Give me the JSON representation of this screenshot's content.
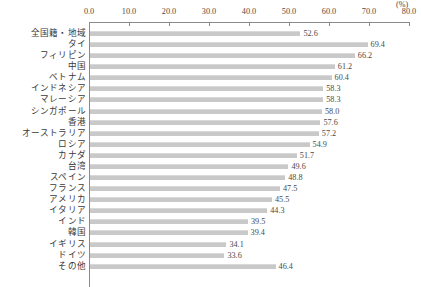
{
  "chart_data": {
    "type": "bar",
    "orientation": "horizontal",
    "title": "",
    "subtitle": "",
    "xlabel": "(%)",
    "ylabel": "",
    "xlim": [
      0.0,
      80.0
    ],
    "xticks": [
      "0.0",
      "10.0",
      "20.0",
      "30.0",
      "40.0",
      "50.0",
      "60.0",
      "70.0",
      "80.0"
    ],
    "xtick_values": [
      0.0,
      10.0,
      20.0,
      30.0,
      40.0,
      50.0,
      60.0,
      70.0,
      80.0
    ],
    "unit_label": "(%)",
    "grid": false,
    "legend": null,
    "categories": [
      "全国籍・地域",
      "タイ",
      "フィリピン",
      "中国",
      "ベトナム",
      "インドネシア",
      "マレーシア",
      "シンガポール",
      "香港",
      "オーストラリア",
      "ロシア",
      "カナダ",
      "台湾",
      "スペイン",
      "フランス",
      "アメリカ",
      "イタリア",
      "インド",
      "韓国",
      "イギリス",
      "ドイツ",
      "その他"
    ],
    "values": [
      52.6,
      69.4,
      66.2,
      61.2,
      60.4,
      58.3,
      58.3,
      58.0,
      57.6,
      57.2,
      54.9,
      51.7,
      49.6,
      48.8,
      47.5,
      45.5,
      44.3,
      39.5,
      39.4,
      34.1,
      33.6,
      46.4
    ],
    "value_labels": [
      "52.6",
      "69.4",
      "66.2",
      "61.2",
      "60.4",
      "58.3",
      "58.3",
      "58.0",
      "57.6",
      "57.2",
      "54.9",
      "51.7",
      "49.6",
      "48.8",
      "47.5",
      "45.5",
      "44.3",
      "39.5",
      "39.4",
      "34.1",
      "33.6",
      "46.4"
    ],
    "bar_color": "#c9c9c9",
    "axis_color": "#8a8a8a",
    "text_color": "#3a3a3a"
  },
  "cropped_top_line": ""
}
